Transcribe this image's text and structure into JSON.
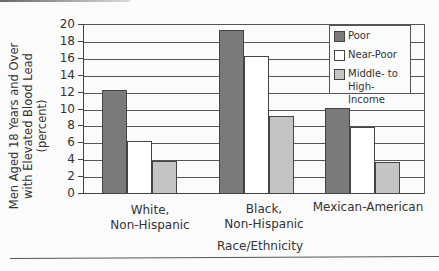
{
  "chart_data": {
    "type": "bar",
    "title": "",
    "xlabel": "Race/Ethnicity",
    "ylabel": "Men Aged 18 Years and Over with Elevated Blood Lead (percent)",
    "ylabel_lines": [
      "Men Aged 18 Years and Over",
      "with Elevated Blood Lead",
      "(percent)"
    ],
    "ylim": [
      0,
      20
    ],
    "yticks": [
      0,
      2,
      4,
      6,
      8,
      10,
      12,
      14,
      16,
      18,
      20
    ],
    "grid": true,
    "legend_position": "upper right (inside)",
    "categories": [
      "White, Non-Hispanic",
      "Black, Non-Hispanic",
      "Mexican-American"
    ],
    "category_lines": [
      [
        "White,",
        "Non-Hispanic"
      ],
      [
        "Black,",
        "Non-Hispanic"
      ],
      [
        "Mexican-American"
      ]
    ],
    "series": [
      {
        "name": "Poor",
        "color": "#7a7a7a",
        "values": [
          12.3,
          19.4,
          10.2
        ]
      },
      {
        "name": "Near-Poor",
        "color": "#ffffff",
        "values": [
          6.3,
          16.3,
          7.9
        ]
      },
      {
        "name": "Middle- to High-Income",
        "color": "#c4c4c4",
        "values": [
          3.9,
          9.2,
          3.8
        ]
      }
    ]
  },
  "legend": {
    "items": [
      {
        "lines": [
          "Poor"
        ]
      },
      {
        "lines": [
          "Near-Poor"
        ]
      },
      {
        "lines": [
          "Middle- to",
          "High-Income"
        ]
      }
    ]
  }
}
